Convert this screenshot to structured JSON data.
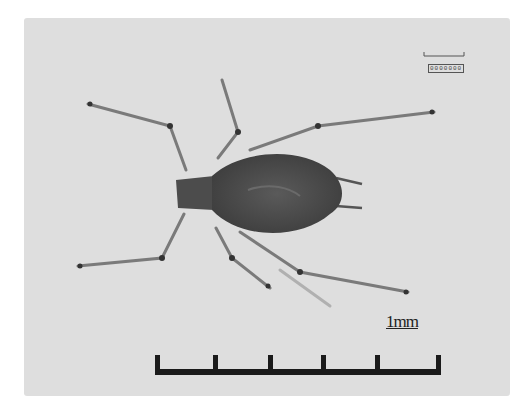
{
  "image": {
    "subject": "aphid",
    "background_color": "#dedede",
    "body_color": "#4a4a4a"
  },
  "scale_bar": {
    "label": "1mm",
    "ticks": 6,
    "color": "#1a1a1a"
  },
  "mini_scale": {
    "label": "0000000"
  }
}
